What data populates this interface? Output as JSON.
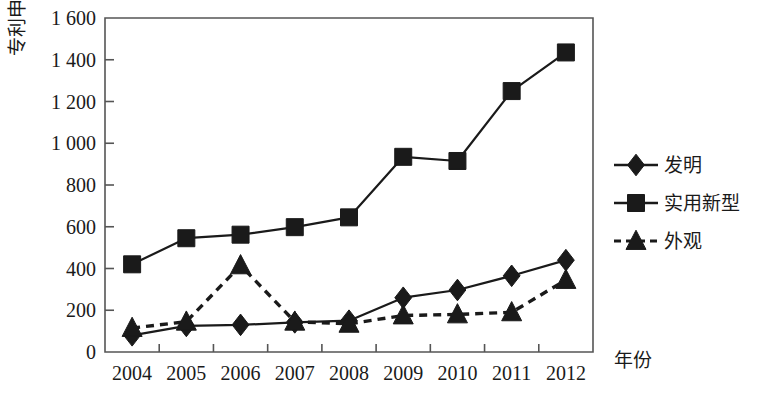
{
  "chart_data": {
    "type": "line",
    "title": "",
    "xlabel": "年份",
    "ylabel": "专利申请量/件",
    "categories": [
      "2004",
      "2005",
      "2006",
      "2007",
      "2008",
      "2009",
      "2010",
      "2011",
      "2012"
    ],
    "x": [
      2004,
      2005,
      2006,
      2007,
      2008,
      2009,
      2010,
      2011,
      2012
    ],
    "ylim": [
      0,
      1600
    ],
    "yticks": [
      0,
      200,
      400,
      600,
      800,
      1000,
      1200,
      1400,
      1600
    ],
    "ytick_labels": [
      "0",
      "200",
      "400",
      "600",
      "800",
      "1 000",
      "1 200",
      "1 400",
      "1 600"
    ],
    "grid": false,
    "legend_position": "right",
    "series": [
      {
        "name": "发明",
        "marker": "diamond",
        "linestyle": "solid",
        "color": "#1a1a1a",
        "values": [
          80,
          125,
          130,
          142,
          150,
          260,
          297,
          365,
          440
        ]
      },
      {
        "name": "实用新型",
        "marker": "square",
        "linestyle": "solid",
        "color": "#1a1a1a",
        "values": [
          420,
          545,
          562,
          598,
          645,
          935,
          915,
          1250,
          1435
        ]
      },
      {
        "name": "外观",
        "marker": "triangle",
        "linestyle": "dashed",
        "color": "#1a1a1a",
        "values": [
          115,
          145,
          415,
          145,
          135,
          175,
          180,
          190,
          345
        ]
      }
    ]
  },
  "axis": {
    "frame_color": "#555555",
    "tick_color": "#555555"
  }
}
